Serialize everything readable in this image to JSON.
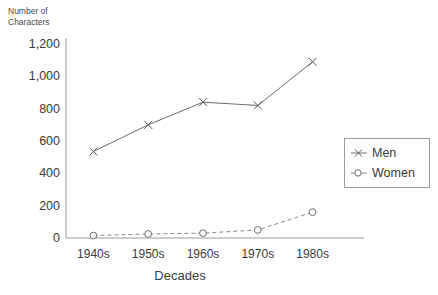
{
  "chart_data": {
    "type": "line",
    "title": "",
    "xlabel": "Decades",
    "ylabel": "Number of\nCharacters",
    "categories": [
      "1940s",
      "1950s",
      "1960s",
      "1970s",
      "1980s"
    ],
    "ylim": [
      0,
      1200
    ],
    "yticks": [
      0,
      200,
      400,
      600,
      800,
      1000,
      1200
    ],
    "ytick_labels": [
      "0",
      "200",
      "400",
      "600",
      "800",
      "1,000",
      "1,200"
    ],
    "grid": false,
    "legend_position": "right",
    "series": [
      {
        "name": "Men",
        "values": [
          535,
          700,
          840,
          820,
          1090
        ],
        "marker": "x-star-marker",
        "line_style": "solid",
        "color": "#6e6e6e"
      },
      {
        "name": "Women",
        "values": [
          15,
          25,
          30,
          50,
          160
        ],
        "marker": "open-circle-marker",
        "line_style": "dashed",
        "color": "#8a8a8a"
      }
    ]
  },
  "legend": {
    "entries": [
      {
        "label": "Men"
      },
      {
        "label": "Women"
      }
    ]
  },
  "colors": {
    "axis": "#9a9a9a",
    "text": "#3a3a3a",
    "men_series": "#6e6e6e",
    "women_series": "#8a8a8a",
    "background": "#ffffff"
  }
}
